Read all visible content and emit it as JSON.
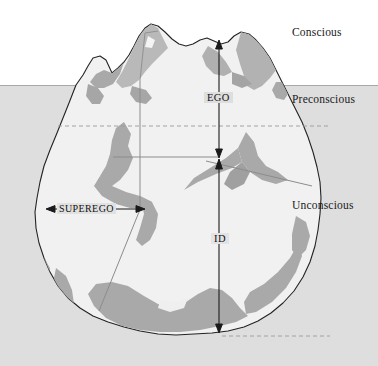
{
  "diagram": {
    "type": "conceptual-diagram",
    "canvas": {
      "width": 378,
      "height": 366
    },
    "colors": {
      "page_background": "#fdfdfd",
      "sky": "#ffffff",
      "water": "#dedede",
      "iceberg_fill": "#efefef",
      "iceberg_shadow": "#a9a9a9",
      "iceberg_shadow_light": "#c0c0c0",
      "outline": "#232323",
      "guide_line": "#8c8c8c",
      "arrow": "#1a1a1a",
      "text": "#111111"
    },
    "zone_labels": [
      {
        "id": "conscious",
        "text": "Conscious",
        "x": 292,
        "y": 26
      },
      {
        "id": "preconscious",
        "text": "Preconscious",
        "x": 292,
        "y": 93
      },
      {
        "id": "unconscious",
        "text": "Unconscious",
        "x": 292,
        "y": 199
      }
    ],
    "structure_labels": [
      {
        "id": "ego",
        "text": "EGO",
        "x": 204,
        "y": 92
      },
      {
        "id": "id",
        "text": "ID",
        "x": 211,
        "y": 233
      },
      {
        "id": "superego",
        "text": "SUPEREGO",
        "x": 57,
        "y": 203
      }
    ],
    "measures": [
      {
        "id": "ego-extent",
        "label": "EGO",
        "orientation": "vertical",
        "from_y": 43,
        "to_y": 155,
        "x": 219
      },
      {
        "id": "id-extent",
        "label": "ID",
        "orientation": "vertical",
        "from_y": 158,
        "to_y": 332,
        "x": 219
      },
      {
        "id": "superego-extent",
        "label": "SUPEREGO",
        "orientation": "horizontal",
        "from_x": 48,
        "to_x": 143,
        "y": 209
      }
    ],
    "water_line_y": 85,
    "dashed_guides_y": [
      126,
      336
    ]
  }
}
